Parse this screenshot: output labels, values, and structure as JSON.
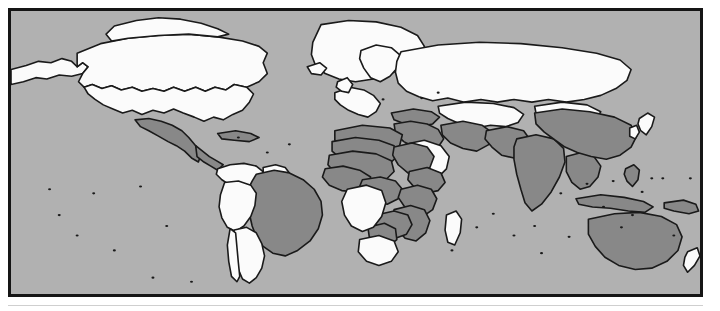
{
  "figure": {
    "type": "world-choropleth-map",
    "projection": "equirectangular",
    "frame_color": "#151515",
    "page_background": "#ffffff",
    "title": ""
  },
  "map": {
    "ocean_color": "#b1b1b1",
    "country_outline_color": "#1a1a1a",
    "categories": [
      {
        "key": "highlighted",
        "label": "",
        "fill": "#888888"
      },
      {
        "key": "other",
        "label": "",
        "fill": "#fbfbfb"
      }
    ],
    "highlighted_countries": [
      "Mexico",
      "Guatemala",
      "Honduras",
      "Nicaragua",
      "Haiti",
      "Brazil",
      "Morocco",
      "Algeria",
      "Tunisia",
      "Libya",
      "Egypt",
      "Mauritania",
      "Mali",
      "Niger",
      "Chad",
      "Sudan",
      "Eritrea",
      "Senegal",
      "Guinea",
      "Sierra Leone",
      "Liberia",
      "Ivory Coast",
      "Burkina Faso",
      "Ghana",
      "Togo",
      "Benin",
      "Nigeria",
      "Cameroon",
      "Central African Republic",
      "South Sudan",
      "Ethiopia",
      "Somalia",
      "Uganda",
      "Kenya",
      "Rwanda",
      "Burundi",
      "Tanzania",
      "Malawi",
      "Mozambique",
      "Zambia",
      "Zimbabwe",
      "Botswana",
      "Eswatini",
      "Turkey",
      "Syria",
      "Iraq",
      "Iran",
      "Yemen",
      "Oman",
      "Afghanistan",
      "Pakistan",
      "India",
      "Nepal",
      "Bangladesh",
      "Bhutan",
      "Myanmar",
      "China",
      "Laos",
      "Philippines",
      "Indonesia",
      "Papua New Guinea",
      "Australia"
    ],
    "other_countries": [
      "United States",
      "Canada",
      "Alaska",
      "Greenland",
      "Colombia",
      "Venezuela",
      "Guyana",
      "Suriname",
      "French Guiana",
      "Ecuador",
      "Peru",
      "Bolivia",
      "Paraguay",
      "Uruguay",
      "Argentina",
      "Chile",
      "United Kingdom",
      "Ireland",
      "France",
      "Spain",
      "Portugal",
      "Italy",
      "Germany",
      "Poland",
      "Norway",
      "Sweden",
      "Finland",
      "Russia",
      "Ukraine",
      "Belarus",
      "Romania",
      "Greece",
      "Kazakhstan",
      "Uzbekistan",
      "Turkmenistan",
      "Mongolia",
      "Japan",
      "South Korea",
      "North Korea",
      "Saudi Arabia",
      "Thailand",
      "Vietnam",
      "Cambodia",
      "Malaysia",
      "Gabon",
      "Republic of the Congo",
      "DR Congo",
      "Angola",
      "Namibia",
      "South Africa",
      "Lesotho",
      "Madagascar",
      "New Zealand"
    ]
  },
  "geometry": {
    "view_box": "0 0 1000 416",
    "paths": {
      "alaska": "M0,86 L22,80 L40,74 L58,76 L74,70 L88,74 L96,82 L104,76 L112,82 L104,92 L88,96 L70,94 L52,100 L36,98 L18,104 L0,108 Z",
      "canada": "M96,62 L130,48 L170,40 L214,36 L258,34 L300,38 L336,44 L360,52 L372,62 L366,76 L372,92 L360,104 L342,112 L324,108 L312,116 L296,112 L282,118 L268,112 L252,118 L236,112 L222,118 L206,114 L190,118 L176,112 L160,116 L146,110 L132,114 L118,108 L106,112 L98,104 L104,92 L112,82 L104,76 L96,82 Z",
      "canada_arctic": "M150,22 L182,14 L214,10 L246,12 L276,18 L300,26 L316,34 L300,38 L258,34 L214,36 L170,40 L146,44 L138,34 Z",
      "usa": "M106,112 L118,108 L132,114 L146,110 L160,116 L176,112 L190,118 L206,114 L222,118 L236,112 L252,118 L268,112 L282,118 L296,112 L312,116 L324,108 L342,112 L352,122 L346,134 L336,146 L322,152 L308,160 L294,156 L280,162 L266,156 L250,150 L236,144 L222,150 L206,146 L190,152 L176,146 L162,150 L148,144 L134,138 L122,130 L112,122 Z",
      "greenland": "M450,20 L490,14 L530,16 L566,24 L590,36 L600,52 L592,68 L574,80 L552,92 L526,100 L500,104 L476,100 L456,92 L442,80 L436,64 L438,46 Z",
      "mexico": "M180,160 L200,158 L218,162 L234,168 L248,176 L258,186 L268,198 L276,210 L272,222 L262,216 L252,206 L240,198 L228,192 L214,184 L200,176 L188,170 Z",
      "centam": "M268,198 L278,206 L288,214 L298,220 L308,226 L300,234 L290,228 L280,222 L270,214 Z",
      "caribbean": "M300,180 L326,176 L348,180 L360,186 L346,192 L324,190 L306,188 Z",
      "colombia_venez": "M300,232 L318,226 L338,224 L356,228 L368,238 L360,250 L346,258 L332,252 L318,256 L306,248 L298,240 Z",
      "guianas": "M366,230 L384,226 L398,230 L404,238 L392,244 L376,242 L366,238 Z",
      "brazil": "M356,240 L382,234 L404,238 L424,248 L440,262 L450,280 L452,300 L446,320 L434,338 L416,352 L398,360 L380,356 L366,346 L356,332 L350,316 L346,298 L342,280 L344,262 L350,250 Z",
      "peru_bolivia": "M310,252 L330,250 L348,256 L356,268 L354,286 L348,302 L338,316 L326,324 L314,318 L306,304 L302,288 L304,270 Z",
      "chile_arg": "M324,322 L342,318 L356,326 L364,342 L368,360 L364,378 L356,392 L346,400 L336,394 L330,380 L326,364 L322,346 Z",
      "chile_strip": "M318,320 L326,326 L328,348 L330,370 L332,390 L328,398 L320,390 L316,368 L314,344 Z",
      "europe_west": "M470,120 L492,112 L512,116 L526,124 L536,136 L530,148 L518,156 L504,152 L490,146 L478,138 L470,130 Z",
      "scandinavia": "M508,58 L530,50 L552,54 L566,66 L562,82 L550,96 L536,104 L522,98 L512,84 L506,70 Z",
      "russia": "M566,60 L620,50 L680,46 L740,48 L800,54 L850,62 L884,72 L900,86 L894,102 L878,114 L856,124 L832,130 L806,134 L780,130 L756,134 L730,130 L706,134 L682,130 L658,134 L634,128 L612,132 L592,126 L574,118 L562,106 L558,90 L560,74 Z",
      "centralasia": "M620,140 L660,134 L700,136 L730,142 L744,152 L736,164 L718,170 L696,168 L674,172 L652,166 L634,158 L622,150 Z",
      "mongolia": "M760,140 L800,134 L836,138 L856,148 L848,160 L824,166 L798,164 L776,158 L762,150 Z",
      "turkey": "M552,150 L584,144 L610,148 L622,156 L612,166 L592,170 L572,166 L556,160 Z",
      "mideast": "M556,166 L580,162 L604,166 L620,174 L628,188 L620,200 L604,206 L586,200 L570,192 L558,180 Z",
      "iran": "M624,168 L656,162 L684,168 L700,180 L694,196 L676,206 L656,202 L638,194 L626,182 Z",
      "arabia": "M572,196 L600,190 L624,198 L636,214 L632,232 L618,246 L600,250 L584,242 L572,226 L566,210 Z",
      "afghan_pak": "M690,176 L720,170 L744,176 L754,190 L746,206 L730,216 L712,212 L698,200 L688,188 Z",
      "india": "M734,188 L762,182 L788,188 L802,202 L804,222 L796,244 L784,266 L770,284 L756,294 L746,282 L740,262 L734,240 L730,218 L730,200 Z",
      "sea_mainland": "M806,214 L828,208 L846,214 L856,228 L852,244 L840,258 L826,262 L814,252 L806,236 Z",
      "china": "M760,150 L800,144 L840,148 L876,156 L900,168 L908,184 L900,200 L884,212 L864,218 L842,214 L822,208 L804,200 L790,190 L774,178 L762,166 Z",
      "japan": "M912,158 L924,150 L934,156 L930,170 L922,182 L914,176 L910,166 Z",
      "korea": "M898,172 L908,168 L912,178 L906,188 L898,184 Z",
      "indonesia": "M820,276 L856,270 L890,274 L918,280 L932,288 L920,296 L896,294 L870,290 L844,288 L824,284 Z",
      "philippines": "M892,232 L904,226 L912,234 L910,248 L902,258 L894,250 L890,240 Z",
      "png": "M948,282 L976,278 L994,284 L998,294 L984,298 L962,294 L948,290 Z",
      "australia": "M838,306 L876,298 L912,296 L944,302 L966,314 L974,332 L968,352 L952,368 L930,378 L906,380 L882,374 L862,362 L848,346 L838,328 Z",
      "newzealand": "M982,354 L996,348 L1000,360 L992,374 L982,384 L976,374 L978,362 Z",
      "nw_africa": "M470,176 L510,168 L550,172 L568,182 L564,198 L548,208 L526,210 L504,206 L484,200 L470,190 Z",
      "sahara_west": "M466,192 L500,186 L534,190 L556,198 L560,214 L548,226 L526,230 L502,226 L480,218 L466,206 Z",
      "sahel": "M462,212 L496,206 L530,210 L552,220 L556,236 L544,248 L520,252 L494,248 L472,240 L460,226 Z",
      "west_africa": "M456,232 L482,228 L506,234 L522,244 L518,258 L502,266 L480,264 L462,256 L452,244 Z",
      "nigeria_cam": "M510,248 L536,244 L558,250 L568,262 L562,276 L546,284 L528,280 L514,270 L506,258 Z",
      "ne_africa": "M556,200 L582,194 L604,200 L614,214 L608,230 L594,242 L576,238 L562,226 L554,212 Z",
      "horn": "M578,236 L604,230 L624,238 L630,252 L620,264 L602,268 L586,260 L576,248 Z",
      "eastafrica": "M566,262 L590,256 L610,262 L618,276 L612,292 L598,302 L582,298 L570,286 L562,274 Z",
      "southeast_africa": "M556,292 L580,286 L600,292 L608,308 L602,326 L588,338 L572,334 L560,320 L552,306 Z",
      "zambia_zim": "M530,300 L556,294 L576,300 L582,314 L574,328 L558,334 L542,328 L530,316 Z",
      "botswana": "M518,318 L542,312 L558,320 L560,336 L548,346 L532,342 L520,332 Z",
      "congo_angola": "M488,262 L516,256 L538,264 L544,282 L538,302 L526,318 L510,324 L494,316 L484,300 L480,280 Z",
      "southafrica": "M506,336 L534,330 L556,338 L562,354 L552,368 L534,374 L516,368 L504,354 Z",
      "madagascar": "M632,300 L646,294 L654,306 L652,326 L644,344 L634,340 L630,322 Z",
      "uk": "M474,104 L488,98 L496,108 L490,120 L480,118 L472,112 Z",
      "iceland": "M430,82 L448,76 L458,84 L450,94 L436,92 Z"
    }
  }
}
